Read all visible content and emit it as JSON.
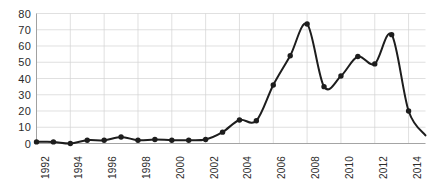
{
  "chart_data": {
    "type": "line",
    "title": "",
    "subtitle": "",
    "xlabel": "",
    "ylabel": "",
    "xlim": [
      1992,
      2015
    ],
    "ylim": [
      0,
      80
    ],
    "ytick_values": [
      0,
      10,
      20,
      30,
      40,
      50,
      60,
      70,
      80
    ],
    "ytick_labels": [
      "0",
      "10",
      "20",
      "30",
      "40",
      "50",
      "60",
      "70",
      "80"
    ],
    "xtick_values": [
      1992,
      1994,
      1996,
      1998,
      2000,
      2002,
      2004,
      2006,
      2008,
      2010,
      2012,
      2014
    ],
    "xtick_labels": [
      "1992",
      "1994",
      "1996",
      "1998",
      "2000",
      "2002",
      "2004",
      "2006",
      "2008",
      "2010",
      "2012",
      "2014"
    ],
    "grid": true,
    "grid_axis": "both",
    "legend": false,
    "legend_position": "none",
    "marker": "circle",
    "marker_color": "#1d1d1d",
    "line_color": "#1d1d1d",
    "background_color": "#ffffff",
    "grid_color": "#d2d2d2",
    "axis_color": "#9a9a9a",
    "interpolation": "smooth",
    "x": [
      1992,
      1993,
      1994,
      1995,
      1996,
      1997,
      1998,
      1999,
      2000,
      2001,
      2002,
      2003,
      2004,
      2005,
      2006,
      2007,
      2008,
      2009,
      2010,
      2011,
      2012,
      2013,
      2014
    ],
    "values": [
      1,
      1,
      0,
      2,
      2,
      4,
      2,
      2.5,
      2,
      2,
      2.5,
      7,
      14.5,
      14,
      36,
      54,
      73.5,
      35,
      41.5,
      53.5,
      49,
      67,
      20
    ],
    "series": [
      {
        "name": "series-1",
        "values": [
          1,
          1,
          0,
          2,
          2,
          4,
          2,
          2.5,
          2,
          2,
          2.5,
          7,
          14.5,
          14,
          36,
          54,
          73.5,
          35,
          41.5,
          53.5,
          49,
          67,
          20
        ]
      }
    ],
    "trailing_segment": {
      "note": "curve continues past last marker toward lower right",
      "end_x": 2015,
      "end_y": 5
    },
    "annotations": []
  }
}
